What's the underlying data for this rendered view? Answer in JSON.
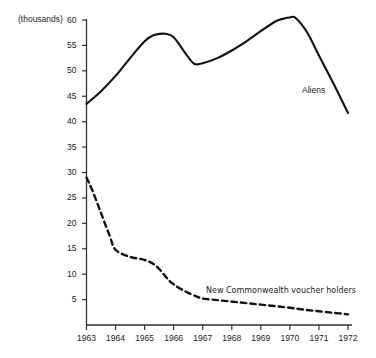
{
  "figure": {
    "title_faint": "",
    "y_axis_unit": "(thousands)"
  },
  "labels": {
    "aliens": "Aliens",
    "new_commonwealth": "New Commonwealth voucher holders"
  },
  "colors": {
    "line": "#111111",
    "axis": "#333333",
    "text": "#222222",
    "background": "#ffffff"
  },
  "chart_data": {
    "type": "line",
    "title": "",
    "xlabel": "",
    "ylabel": "(thousands)",
    "xlim": [
      1963,
      1972
    ],
    "ylim": [
      0,
      60
    ],
    "yticks": [
      5,
      10,
      15,
      20,
      25,
      30,
      35,
      40,
      45,
      50,
      55,
      60
    ],
    "xticks": [
      1963,
      1964,
      1965,
      1966,
      1967,
      1968,
      1969,
      1970,
      1971,
      1972
    ],
    "ytick_labels": [
      "5",
      "10",
      "15",
      "20",
      "25",
      "30",
      "35",
      "40",
      "45",
      "50",
      "55",
      "60"
    ],
    "xtick_labels": [
      "1963",
      "1964",
      "1965",
      "1966",
      "1967",
      "1968",
      "1969",
      "1970",
      "1971",
      "1972"
    ],
    "grid": false,
    "legend_position": "inline-annotation",
    "series": [
      {
        "name": "Aliens",
        "style": "solid",
        "x": [
          1963.0,
          1963.5,
          1964.0,
          1964.5,
          1965.0,
          1965.3,
          1965.7,
          1966.0,
          1966.4,
          1966.7,
          1967.0,
          1967.5,
          1968.0,
          1968.5,
          1969.0,
          1969.5,
          1969.8,
          1970.0,
          1970.2,
          1970.6,
          1971.0,
          1971.5,
          1972.0
        ],
        "values": [
          43.5,
          46.0,
          49.0,
          52.5,
          55.8,
          57.0,
          57.3,
          56.6,
          53.5,
          51.4,
          51.5,
          52.5,
          54.0,
          55.8,
          57.8,
          59.7,
          60.3,
          60.5,
          60.4,
          57.5,
          53.0,
          47.5,
          41.7
        ]
      },
      {
        "name": "New Commonwealth voucher holders",
        "style": "dashed",
        "x": [
          1963.0,
          1963.2,
          1963.5,
          1963.8,
          1964.0,
          1964.5,
          1965.0,
          1965.4,
          1965.8,
          1966.0,
          1966.4,
          1966.8,
          1967.0,
          1967.5,
          1968.0,
          1968.5,
          1969.0,
          1969.5,
          1970.0,
          1970.5,
          1971.0,
          1971.5,
          1972.0
        ],
        "values": [
          29.0,
          26.5,
          22.0,
          17.5,
          14.8,
          13.4,
          12.8,
          11.6,
          9.0,
          8.0,
          6.6,
          5.6,
          5.2,
          4.9,
          4.6,
          4.3,
          4.0,
          3.7,
          3.4,
          3.0,
          2.7,
          2.4,
          2.1
        ]
      }
    ]
  }
}
